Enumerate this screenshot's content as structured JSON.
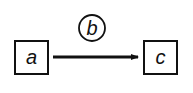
{
  "diagram": {
    "nodes": [
      {
        "id": "a",
        "label": "a",
        "shape": "square"
      },
      {
        "id": "b",
        "label": "b",
        "shape": "circle"
      },
      {
        "id": "c",
        "label": "c",
        "shape": "square"
      }
    ],
    "edges": [
      {
        "from": "a",
        "to": "c",
        "label_node": "b",
        "style": "thick-arrow"
      }
    ],
    "colors": {
      "stroke": "#111111",
      "background": "#ffffff"
    }
  }
}
